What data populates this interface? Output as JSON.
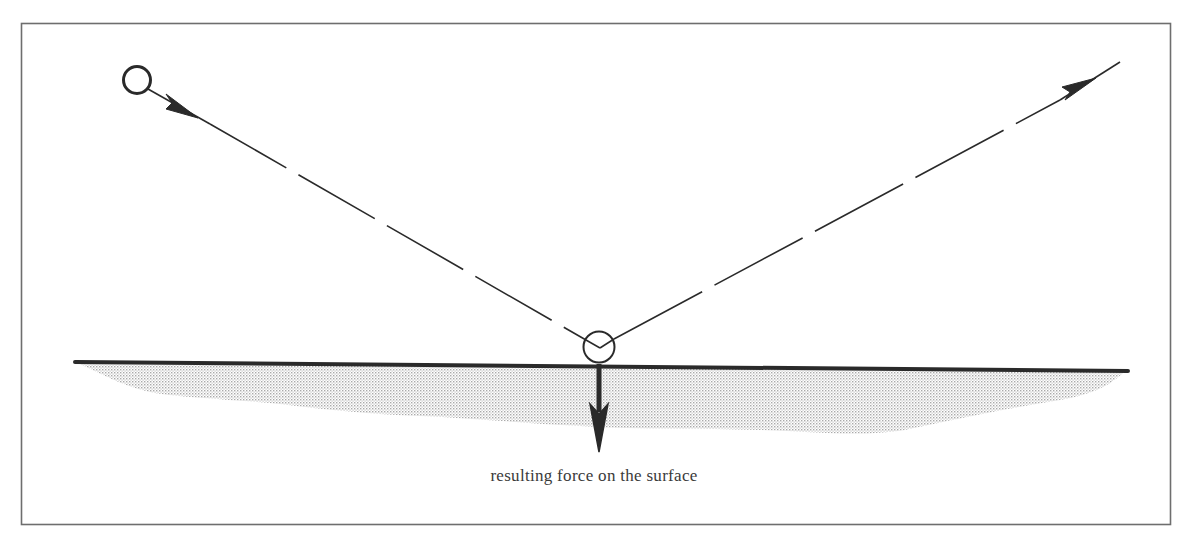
{
  "diagram": {
    "caption": "resulting force on the surface",
    "colors": {
      "ink": "#2a2a2a",
      "frame": "#6e6e6e",
      "surface_shading": "#c8c8c8",
      "background": "#ffffff"
    },
    "elements": {
      "incoming_ball": {
        "label": "ball (before impact)"
      },
      "incoming_path": {
        "label": "incoming trajectory",
        "style": "dashed"
      },
      "impact_ball": {
        "label": "ball at impact"
      },
      "outgoing_path": {
        "label": "reflected trajectory",
        "style": "dashed"
      },
      "surface": {
        "label": "surface"
      },
      "force_arrow": {
        "label": "resulting force on the surface",
        "direction": "down"
      }
    }
  }
}
